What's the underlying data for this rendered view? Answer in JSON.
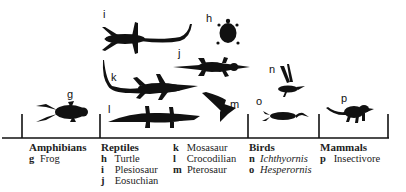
{
  "groups": [
    {
      "title": "Amphibians",
      "items": [
        {
          "key": "g",
          "name": "Frog",
          "italic": false
        }
      ]
    },
    {
      "title": "Reptiles",
      "items": [
        {
          "key": "h",
          "name": "Turtle",
          "italic": false
        },
        {
          "key": "i",
          "name": "Plesiosaur",
          "italic": false
        },
        {
          "key": "j",
          "name": "Eosuchian",
          "italic": false
        },
        {
          "key": "k",
          "name": "Mosasaur",
          "italic": false
        },
        {
          "key": "l",
          "name": "Crocodilian",
          "italic": false
        },
        {
          "key": "m",
          "name": "Pterosaur",
          "italic": false
        }
      ]
    },
    {
      "title": "Birds",
      "items": [
        {
          "key": "n",
          "name": "Ichthyornis",
          "italic": true
        },
        {
          "key": "o",
          "name": "Hesperornis",
          "italic": true
        }
      ]
    },
    {
      "title": "Mammals",
      "items": [
        {
          "key": "p",
          "name": "Insectivore",
          "italic": false
        }
      ]
    }
  ],
  "figure_labels": {
    "g": "g",
    "h": "h",
    "i": "i",
    "j": "j",
    "k": "k",
    "l": "l",
    "m": "m",
    "n": "n",
    "o": "o",
    "p": "p"
  },
  "colors": {
    "ink": "#111111",
    "background": "#ffffff"
  }
}
